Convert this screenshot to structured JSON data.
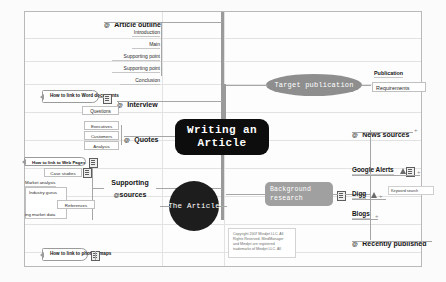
{
  "app": {
    "name": "MindManager",
    "map_title": "Writing an Article"
  },
  "central": {
    "line1": "Writing an",
    "line2": "Article"
  },
  "nodes": {
    "article_outline": {
      "label": "Article outline",
      "children": [
        "Introduction",
        "Main",
        "Supporting point",
        "Supporting point",
        "Conclusion"
      ]
    },
    "interview": {
      "label": "Interview",
      "children": [
        "Questions"
      ],
      "callout": "How to link to Word documents"
    },
    "quotes": {
      "label": "Quotes",
      "children": [
        "Executives",
        "Customers",
        "Analysis"
      ]
    },
    "supporting_sources": {
      "line1": "Supporting",
      "line2": "sources",
      "children": [
        "Case studies",
        "Market analysis",
        "Industry gurus",
        "References",
        "ing market data"
      ],
      "callout": "How to link to Web Pages"
    },
    "the_article": {
      "label": "The Article"
    },
    "target_publication": {
      "label": "Target publication",
      "children": [
        "Publication",
        "Requirements"
      ]
    },
    "background_research": {
      "line1": "Background",
      "line2": "research",
      "children": [
        "News sources",
        "Google Alerts",
        "Digg",
        "Blogs",
        "Recently published"
      ],
      "tag": "Keyword search"
    },
    "photos_callout": {
      "label": "How to link to photos, maps"
    }
  },
  "copyright": {
    "line1": "Copyright 2007 Mindjet LLC.  All",
    "line2": "Rights Reserved. MindManager",
    "line3": "and Mindjet are registered",
    "line4": "trademarks of Mindjet LLC. All"
  },
  "icons": {
    "at": "@",
    "note": "note-icon",
    "person": "person-icon",
    "plus": "+"
  },
  "colors": {
    "central_bg": "#0d0d0d",
    "circle_bg": "#1d1d1d",
    "ellipse_bg": "#8e8e8e",
    "gray_box_bg": "#a0a0a0",
    "connector": "#a6a6a6",
    "grid": "#e2e2e2"
  }
}
